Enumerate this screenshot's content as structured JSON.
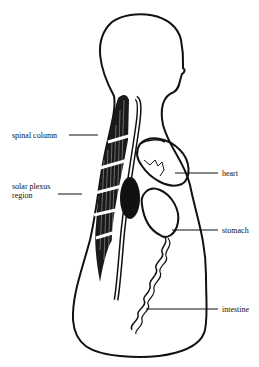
{
  "diagram": {
    "labels": [
      {
        "id": "spinal-column",
        "text": "spinal column"
      },
      {
        "id": "solar-plexus",
        "text_line1": "solar plexus",
        "text_line2": "region"
      },
      {
        "id": "heart",
        "text": "heart"
      },
      {
        "id": "stomach",
        "text": "stomach"
      },
      {
        "id": "intestine",
        "text": "intestine"
      }
    ]
  }
}
